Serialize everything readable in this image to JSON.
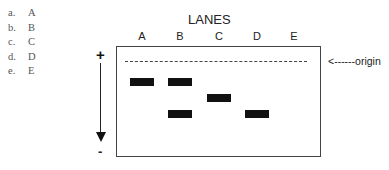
{
  "options": [
    {
      "key": "a.",
      "value": "A"
    },
    {
      "key": "b.",
      "value": "B"
    },
    {
      "key": "c.",
      "value": "C"
    },
    {
      "key": "d.",
      "value": "D"
    },
    {
      "key": "e.",
      "value": "E"
    }
  ],
  "gel": {
    "title": "LANES",
    "lanes": [
      "A",
      "B",
      "C",
      "D",
      "E"
    ],
    "origin_label": "<------origin",
    "positive_label": "+",
    "negative_label": "-",
    "bands": [
      {
        "lane": "A",
        "position": 1
      },
      {
        "lane": "B",
        "position": 1
      },
      {
        "lane": "C",
        "position": 2
      },
      {
        "lane": "B",
        "position": 3
      },
      {
        "lane": "D",
        "position": 3
      }
    ]
  }
}
